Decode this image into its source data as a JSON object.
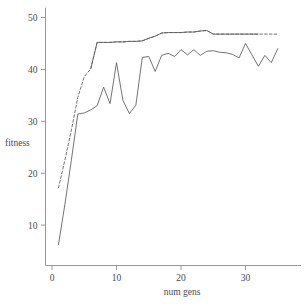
{
  "chart_data": {
    "type": "line",
    "title": "",
    "xlabel": "num gens",
    "ylabel": "fitness",
    "xlim": [
      -1.2,
      36.5
    ],
    "ylim": [
      2.0,
      51.5
    ],
    "xticks": [
      0,
      10,
      20,
      30
    ],
    "yticks": [
      10,
      20,
      30,
      40,
      50
    ],
    "xtick_labels": [
      "0",
      "10",
      "20",
      "30"
    ],
    "ytick_labels": [
      "10",
      "20",
      "30",
      "40",
      "50"
    ],
    "grid": false,
    "legend": "none",
    "axis_color": "#8c8c8c",
    "line_color": "#5a5a5a",
    "series": [
      {
        "name": "best fitness",
        "style": "dashed",
        "color": "#5a5a5a",
        "x": [
          1,
          2,
          3,
          4,
          5,
          6,
          7,
          8,
          9,
          10,
          11,
          12,
          13,
          14,
          15,
          16,
          17,
          18,
          19,
          20,
          21,
          22,
          23,
          24,
          25,
          26,
          27,
          28,
          29,
          30,
          31,
          32,
          33,
          34,
          35
        ],
        "values": [
          17.2,
          22.5,
          28.3,
          34.6,
          38.6,
          40.1,
          45.2,
          45.2,
          45.2,
          45.3,
          45.3,
          45.4,
          45.4,
          45.5,
          46.0,
          46.4,
          47.0,
          47.1,
          47.1,
          47.1,
          47.2,
          47.2,
          47.4,
          47.5,
          46.8,
          46.8,
          46.8,
          46.8,
          46.8,
          46.8,
          46.8,
          46.8,
          46.8,
          46.8,
          46.8
        ]
      },
      {
        "name": "average fitness",
        "style": "solid",
        "color": "#5a5a5a",
        "x": [
          1,
          2,
          3,
          4,
          5,
          6,
          7,
          8,
          9,
          10,
          11,
          12,
          13,
          14,
          15,
          16,
          17,
          18,
          19,
          20,
          21,
          22,
          23,
          24,
          25,
          26,
          27,
          28,
          29,
          30,
          31,
          32,
          33,
          34,
          35
        ],
        "values": [
          6.2,
          14.0,
          22.5,
          31.4,
          31.6,
          32.2,
          33.0,
          36.6,
          33.4,
          41.3,
          34.0,
          31.5,
          33.1,
          42.3,
          42.5,
          39.6,
          42.7,
          43.1,
          42.5,
          43.8,
          42.8,
          43.8,
          42.7,
          43.5,
          43.6,
          43.3,
          43.2,
          42.9,
          42.2,
          45.0,
          42.8,
          40.6,
          42.7,
          41.3,
          44.0
        ]
      }
    ]
  }
}
